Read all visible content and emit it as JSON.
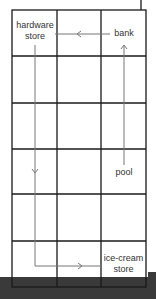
{
  "diagram": {
    "type": "grid-map",
    "grid": {
      "rows": 6,
      "cols": 3
    },
    "colors": {
      "grid_line": "#1a1a1a",
      "path_line": "#777777",
      "background": "#ffffff",
      "bottom_band": "#3a3a3a"
    },
    "places": [
      {
        "id": "hardware-store",
        "line1": "hardware",
        "line2": "store",
        "cell": [
          0,
          0
        ]
      },
      {
        "id": "bank",
        "line1": "bank",
        "line2": "",
        "cell": [
          0,
          2
        ]
      },
      {
        "id": "pool",
        "line1": "pool",
        "line2": "",
        "cell": [
          3,
          2
        ]
      },
      {
        "id": "ice-cream-store",
        "line1": "ice-cream",
        "line2": "store",
        "cell": [
          5,
          2
        ]
      }
    ],
    "route": [
      {
        "from": "pool",
        "to": "bank",
        "direction": "up"
      },
      {
        "from": "bank",
        "to": "hardware-store",
        "direction": "left"
      },
      {
        "from": "hardware-store",
        "to": "ice-cream-store",
        "direction": "down-then-right"
      }
    ]
  }
}
